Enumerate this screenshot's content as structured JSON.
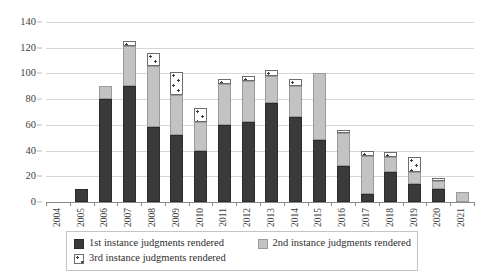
{
  "chart_data": {
    "type": "bar",
    "stacked": true,
    "title": "",
    "xlabel": "",
    "ylabel": "",
    "ylim": [
      0,
      140
    ],
    "ytick_step": 20,
    "yticks": [
      0,
      20,
      40,
      60,
      80,
      100,
      120,
      140
    ],
    "grid": true,
    "legend_position": "bottom",
    "categories": [
      "2004",
      "2005",
      "2006",
      "2007",
      "2008",
      "2009",
      "2010",
      "2011",
      "2012",
      "2013",
      "2014",
      "2015",
      "2016",
      "2017",
      "2018",
      "2019",
      "2020",
      "2021"
    ],
    "series": [
      {
        "name": "1st instance judgments rendered",
        "color": "#3a3a3a",
        "values": [
          0,
          10,
          80,
          90,
          58,
          52,
          40,
          60,
          62,
          77,
          66,
          48,
          28,
          6,
          23,
          14,
          10,
          0
        ]
      },
      {
        "name": "2nd instance judgments rendered",
        "color": "#c3c3c3",
        "values": [
          0,
          0,
          10,
          31,
          48,
          31,
          22,
          32,
          32,
          21,
          24,
          52,
          26,
          30,
          12,
          9,
          6,
          8
        ]
      },
      {
        "name": "3rd instance judgments rendered",
        "color": "#ffffff",
        "pattern": "dotted",
        "values": [
          0,
          0,
          0,
          4,
          10,
          18,
          11,
          4,
          4,
          5,
          6,
          0,
          2,
          4,
          4,
          12,
          3,
          0
        ]
      }
    ],
    "totals": [
      0,
      10,
      90,
      125,
      116,
      101,
      73,
      96,
      98,
      103,
      96,
      100,
      56,
      40,
      39,
      35,
      19,
      8
    ]
  },
  "legend": {
    "items": [
      {
        "label": "1st instance judgments rendered",
        "swatch": "dark-square-swatch"
      },
      {
        "label": "2nd instance judgments rendered",
        "swatch": "gray-square-swatch"
      },
      {
        "label": "3rd instance judgments rendered",
        "swatch": "dotted-square-swatch"
      }
    ]
  }
}
